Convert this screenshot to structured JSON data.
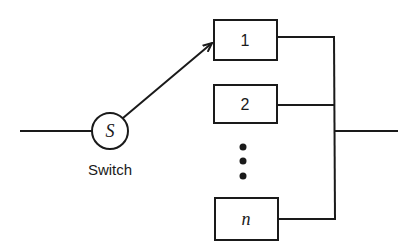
{
  "diagram": {
    "type": "standby-redundancy-switch",
    "switch": {
      "symbol": "S",
      "label": "Switch"
    },
    "units": [
      {
        "id": "unit-1",
        "label": "1"
      },
      {
        "id": "unit-2",
        "label": "2"
      },
      {
        "id": "unit-n",
        "label": "n"
      }
    ],
    "ellipsis": "⋮",
    "colors": {
      "stroke": "#1a1a1a",
      "background": "#ffffff"
    }
  }
}
